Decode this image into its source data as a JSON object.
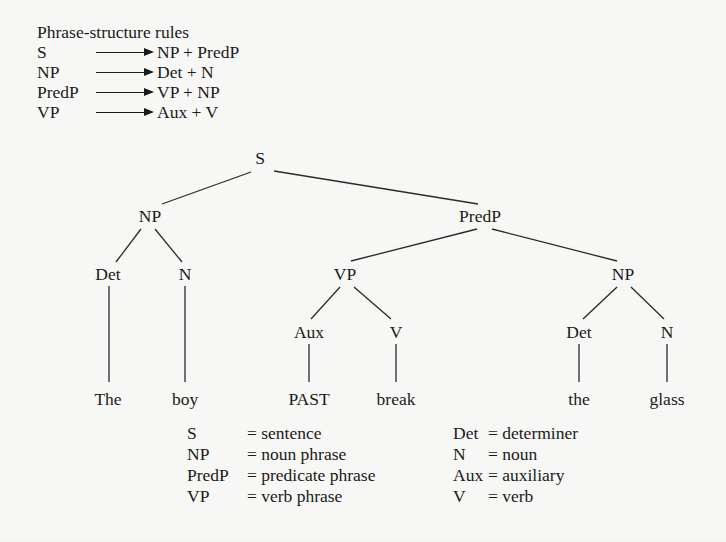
{
  "rules": {
    "title": "Phrase-structure rules",
    "items": [
      {
        "lhs": "S",
        "rhs": "NP + PredP"
      },
      {
        "lhs": "NP",
        "rhs": "Det + N"
      },
      {
        "lhs": "PredP",
        "rhs": "VP + NP"
      },
      {
        "lhs": "VP",
        "rhs": "Aux + V"
      }
    ],
    "arrow_icon": "right-arrow-icon"
  },
  "tree": {
    "nodes": {
      "s": {
        "label": "S",
        "x": 260,
        "y": 164
      },
      "np1": {
        "label": "NP",
        "x": 150,
        "y": 222
      },
      "predp": {
        "label": "PredP",
        "x": 480,
        "y": 222
      },
      "det1": {
        "label": "Det",
        "x": 108,
        "y": 280
      },
      "n1": {
        "label": "N",
        "x": 185,
        "y": 280
      },
      "vp": {
        "label": "VP",
        "x": 345,
        "y": 280
      },
      "np2": {
        "label": "NP",
        "x": 623,
        "y": 280
      },
      "aux": {
        "label": "Aux",
        "x": 309,
        "y": 338
      },
      "v": {
        "label": "V",
        "x": 396,
        "y": 338
      },
      "det2": {
        "label": "Det",
        "x": 579,
        "y": 338
      },
      "n2": {
        "label": "N",
        "x": 667,
        "y": 338
      }
    },
    "leaves": {
      "the1": {
        "label": "The",
        "x": 108,
        "y": 405
      },
      "boy": {
        "label": "boy",
        "x": 185,
        "y": 405
      },
      "past": {
        "label": "PAST",
        "x": 309,
        "y": 405
      },
      "break": {
        "label": "break",
        "x": 396,
        "y": 405
      },
      "the2": {
        "label": "the",
        "x": 579,
        "y": 405
      },
      "glass": {
        "label": "glass",
        "x": 667,
        "y": 405
      }
    }
  },
  "legend": {
    "left": [
      {
        "abbr": "S",
        "def": "= sentence"
      },
      {
        "abbr": "NP",
        "def": "= noun phrase"
      },
      {
        "abbr": "PredP",
        "def": "= predicate phrase"
      },
      {
        "abbr": "VP",
        "def": "= verb phrase"
      }
    ],
    "right": [
      {
        "abbr": "Det",
        "def": "= determiner"
      },
      {
        "abbr": "N",
        "def": "= noun"
      },
      {
        "abbr": "Aux",
        "def": "= auxiliary"
      },
      {
        "abbr": "V",
        "def": "= verb"
      }
    ]
  }
}
